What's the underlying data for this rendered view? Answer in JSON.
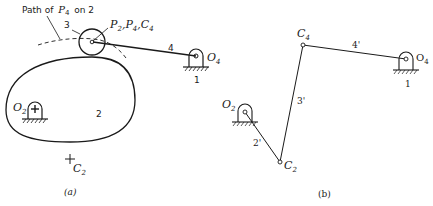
{
  "figure_a": {
    "caption": "(a)",
    "path_label": "Path of",
    "path_label_sub_var": "P",
    "path_label_sub": "4",
    "path_label_tail": "on 2",
    "roller_label": "3",
    "point_label_P2": "P",
    "point_label_P2_sub": "2",
    "point_label_P4": "P",
    "point_label_P4_sub": "4",
    "point_label_C4": "C",
    "point_label_C4_sub": "4",
    "link_4": "4",
    "pivot_O4": "O",
    "pivot_O4_sub": "4",
    "ground_1": "1",
    "pivot_O2": "O",
    "pivot_O2_sub": "2",
    "cam_label": "2",
    "center_C2": "C",
    "center_C2_sub": "2"
  },
  "figure_b": {
    "caption": "(b)",
    "point_C4": "C",
    "point_C4_sub": "4",
    "link_4p": "4'",
    "pivot_O4": "O",
    "pivot_O4_sub": "4",
    "ground_1": "1",
    "link_3p": "3'",
    "pivot_O2": "O",
    "pivot_O2_sub": "2",
    "link_2p": "2'",
    "point_C2": "C",
    "point_C2_sub": "2"
  }
}
